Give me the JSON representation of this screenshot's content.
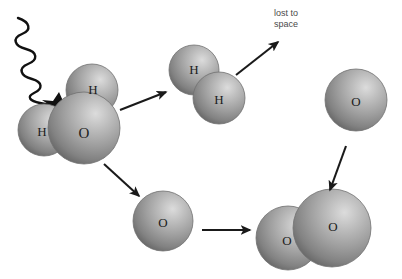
{
  "diagram": {
    "background_color": "#ffffff",
    "sphere": {
      "base_color": "#9a9a9a",
      "highlight_color": "#d8d8d8",
      "shadow_color": "#5c5c5c",
      "outline_color": "#6e6e6e"
    },
    "arrow_color": "#1a1a1a",
    "label_color": "#1c1c1c",
    "caption_color": "#4a4a4a"
  },
  "captions": {
    "lost_to_space": "lost to\nspace"
  },
  "molecules": {
    "water": {
      "name": "water-molecule",
      "atoms": [
        {
          "element": "O",
          "cx": 84,
          "cy": 128,
          "r": 36
        },
        {
          "element": "H",
          "cx": 92,
          "cy": 90,
          "r": 26
        },
        {
          "element": "H",
          "cx": 44,
          "cy": 130,
          "r": 26
        }
      ]
    },
    "hydrogen": {
      "name": "hydrogen-molecule",
      "atoms": [
        {
          "element": "H",
          "cx": 194,
          "cy": 70,
          "r": 25
        },
        {
          "element": "H",
          "cx": 219,
          "cy": 98,
          "r": 26
        }
      ]
    },
    "oxygen_atom_lower": {
      "name": "oxygen-atom-lower",
      "atoms": [
        {
          "element": "O",
          "cx": 163,
          "cy": 221,
          "r": 30
        }
      ]
    },
    "oxygen_atom_right": {
      "name": "oxygen-atom-right",
      "atoms": [
        {
          "element": "O",
          "cx": 356,
          "cy": 100,
          "r": 31
        }
      ]
    },
    "oxygen_molecule": {
      "name": "oxygen-molecule",
      "atoms": [
        {
          "element": "O",
          "cx": 288,
          "cy": 238,
          "r": 32
        },
        {
          "element": "O",
          "cx": 332,
          "cy": 228,
          "r": 39
        }
      ]
    }
  },
  "photon": {
    "name": "incoming-photon",
    "description": "wavy ultraviolet photon ray striking the water molecule"
  },
  "impact": {
    "name": "photon-impact-burst",
    "cx": 59,
    "cy": 104
  },
  "arrows": [
    {
      "name": "arrow-water-to-hydrogen",
      "x1": 120,
      "y1": 110,
      "x2": 166,
      "y2": 92
    },
    {
      "name": "arrow-water-to-oxygen",
      "x1": 104,
      "y1": 164,
      "x2": 139,
      "y2": 196
    },
    {
      "name": "arrow-hydrogen-to-space",
      "x1": 236,
      "y1": 75,
      "x2": 278,
      "y2": 42
    },
    {
      "name": "arrow-oxygen-to-oxygen-molecule",
      "x1": 202,
      "y1": 230,
      "x2": 250,
      "y2": 230
    },
    {
      "name": "arrow-oxygen-right-down",
      "x1": 346,
      "y1": 146,
      "x2": 330,
      "y2": 190
    }
  ]
}
